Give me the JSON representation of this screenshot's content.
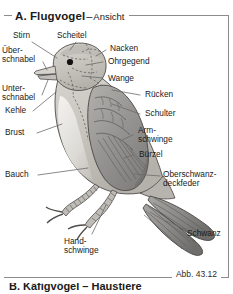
{
  "figure": {
    "title_main": "A. Flugvogel",
    "title_dash": "–",
    "title_sub": "Ansicht",
    "caption": "Abb. 43.12",
    "bottom_cut_text": "B. Käfigvögel – Haustiere",
    "colors": {
      "frame": "#8c8c8c",
      "text": "#1a1a1a",
      "leader_line": "#6b6b6b",
      "body_fill": "#c9c6c0",
      "body_light": "#e3e1dc",
      "wing_dark": "#8d8d8d",
      "wing_mid": "#a9a7a3",
      "tail_dark": "#9a9a9a",
      "outline": "#4a4a4a",
      "dashed": "#5f5f5f",
      "eye": "#111111"
    }
  },
  "labels": [
    {
      "id": "stirn",
      "lines": [
        "Stirn"
      ]
    },
    {
      "id": "scheitel",
      "lines": [
        "Scheitel"
      ]
    },
    {
      "id": "nacken",
      "lines": [
        "Nacken"
      ]
    },
    {
      "id": "oberschnabel",
      "lines": [
        "Über-",
        "schnabel"
      ]
    },
    {
      "id": "ohrgegend",
      "lines": [
        "Ohrgegend"
      ]
    },
    {
      "id": "wange",
      "lines": [
        "Wange"
      ]
    },
    {
      "id": "unterschnabel",
      "lines": [
        "Unter-",
        "schnabel"
      ]
    },
    {
      "id": "kehle",
      "lines": [
        "Kehle"
      ]
    },
    {
      "id": "ruecken",
      "lines": [
        "Rücken"
      ]
    },
    {
      "id": "schulter",
      "lines": [
        "Schulter"
      ]
    },
    {
      "id": "brust",
      "lines": [
        "Brust"
      ]
    },
    {
      "id": "armschwinge",
      "lines": [
        "Arm-",
        "schwinge"
      ]
    },
    {
      "id": "buerzel",
      "lines": [
        "Bürzel"
      ]
    },
    {
      "id": "oberschwanzdeckfeder",
      "lines": [
        "Oberschwanz-",
        "deckfeder"
      ]
    },
    {
      "id": "bauch",
      "lines": [
        "Bauch"
      ]
    },
    {
      "id": "handschwinge",
      "lines": [
        "Hand-",
        "schwinge"
      ]
    },
    {
      "id": "schwanz",
      "lines": [
        "Schwanz"
      ]
    }
  ]
}
